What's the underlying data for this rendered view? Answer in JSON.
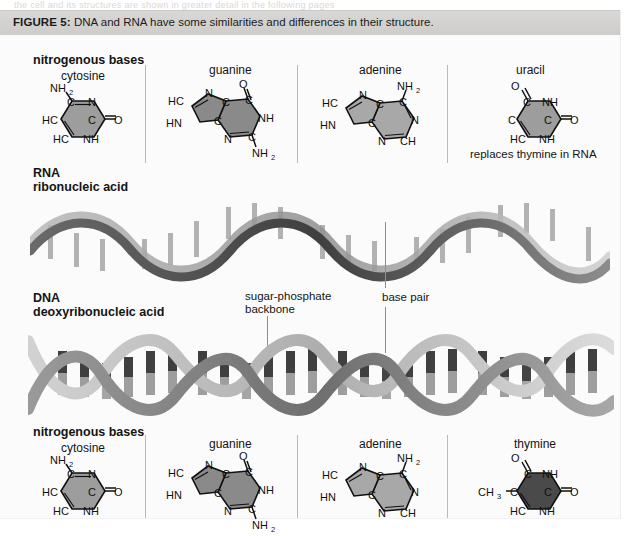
{
  "page": {
    "ghost_line_above": "the cell and its structures are shown in greater detail in the following pages"
  },
  "figure": {
    "caption_label": "FIGURE 5:",
    "caption_text": "DNA and RNA have some similarities and differences in their structure.",
    "top_section": {
      "heading": "nitrogenous bases",
      "bases": [
        {
          "name": "cytosine",
          "kind": "pyrimidine",
          "fill": "#9d9d9d",
          "atoms": [
            "NH2",
            "C",
            "N",
            "HC",
            "C",
            "O",
            "HC",
            "NH"
          ]
        },
        {
          "name": "guanine",
          "kind": "purine",
          "fill": "#8a8a8a",
          "atoms": [
            "HC",
            "N",
            "C",
            "O",
            "C",
            "HN",
            "NH",
            "C",
            "N",
            "C",
            "NH2"
          ]
        },
        {
          "name": "adenine",
          "kind": "purine",
          "fill": "#a8a8a8",
          "atoms": [
            "HC",
            "N",
            "NH2",
            "C",
            "C",
            "HN",
            "C",
            "N",
            "N",
            "CH"
          ]
        },
        {
          "name": "uracil",
          "kind": "pyrimidine",
          "fill": "#9d9d9d",
          "note": "replaces thymine in RNA",
          "atoms": [
            "O",
            "C",
            "NH",
            "C",
            "C",
            "O",
            "HC",
            "NH"
          ]
        }
      ]
    },
    "rna": {
      "name": "RNA",
      "full_name": "ribonucleic acid",
      "structure": "single helix"
    },
    "dna": {
      "name": "DNA",
      "full_name": "deoxyribonucleic acid",
      "structure": "double helix"
    },
    "annotations": [
      {
        "label_line1": "sugar-phosphate",
        "label_line2": "backbone"
      },
      {
        "label_line1": "base pair",
        "label_line2": ""
      }
    ],
    "bottom_section": {
      "heading": "nitrogenous bases",
      "bases": [
        {
          "name": "cytosine",
          "kind": "pyrimidine",
          "fill": "#9d9d9d",
          "atoms": [
            "NH2",
            "C",
            "N",
            "HC",
            "C",
            "O",
            "HC",
            "NH"
          ]
        },
        {
          "name": "guanine",
          "kind": "purine",
          "fill": "#8a8a8a",
          "atoms": [
            "HC",
            "N",
            "C",
            "O",
            "C",
            "HN",
            "NH",
            "C",
            "N",
            "C",
            "NH2"
          ]
        },
        {
          "name": "adenine",
          "kind": "purine",
          "fill": "#a8a8a8",
          "atoms": [
            "HC",
            "N",
            "NH2",
            "C",
            "C",
            "HN",
            "C",
            "N",
            "N",
            "CH"
          ]
        },
        {
          "name": "thymine",
          "kind": "pyrimidine",
          "fill": "#4a4a4a",
          "atoms": [
            "O",
            "C",
            "NH",
            "CH3",
            "C",
            "C",
            "O",
            "HC",
            "NH"
          ]
        }
      ]
    },
    "colors": {
      "caption_bar": "#d5d4d1",
      "page_background": "#fbfbfb",
      "divider": "#b9b9b9",
      "ribbon_dark": "#5f5f5f",
      "ribbon_light": "#c2c2c2",
      "base_pair_dark": "#3f3f3f",
      "base_pair_light": "#b5b5b5"
    }
  }
}
